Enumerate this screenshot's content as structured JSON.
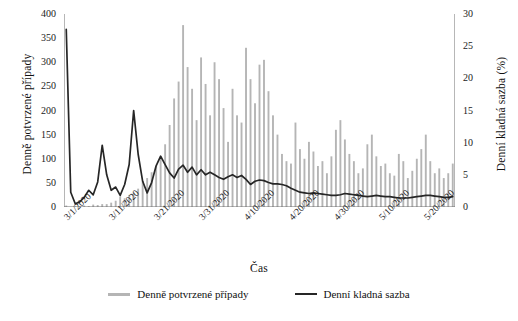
{
  "chart_data": {
    "type": "bar",
    "title": "",
    "xlabel": "Čas",
    "ylabel": "Denně potvrzené případy",
    "y2label": "Denní kladná sazba (%)",
    "ylim": [
      0,
      400
    ],
    "y2lim": [
      0,
      30
    ],
    "grid": false,
    "legend_position": "bottom",
    "y_ticks": [
      "0",
      "50",
      "100",
      "150",
      "200",
      "250",
      "300",
      "350",
      "400"
    ],
    "y2_ticks": [
      "0",
      "5",
      "10",
      "15",
      "20",
      "25",
      "30"
    ],
    "x_tick_labels": [
      "3/1/2020",
      "3/11/2020",
      "3/21/2020",
      "3/31/2020",
      "4/10/2020",
      "4/20/2020",
      "4/30/2020",
      "5/10/2020",
      "5/20/2020"
    ],
    "x_tick_indices": [
      0,
      10,
      20,
      30,
      40,
      50,
      60,
      70,
      80
    ],
    "x": [
      "3/1/2020",
      "3/2/2020",
      "3/3/2020",
      "3/4/2020",
      "3/5/2020",
      "3/6/2020",
      "3/7/2020",
      "3/8/2020",
      "3/9/2020",
      "3/10/2020",
      "3/11/2020",
      "3/12/2020",
      "3/13/2020",
      "3/14/2020",
      "3/15/2020",
      "3/16/2020",
      "3/17/2020",
      "3/18/2020",
      "3/19/2020",
      "3/20/2020",
      "3/21/2020",
      "3/22/2020",
      "3/23/2020",
      "3/24/2020",
      "3/25/2020",
      "3/26/2020",
      "3/27/2020",
      "3/28/2020",
      "3/29/2020",
      "3/30/2020",
      "3/31/2020",
      "4/1/2020",
      "4/2/2020",
      "4/3/2020",
      "4/4/2020",
      "4/5/2020",
      "4/6/2020",
      "4/7/2020",
      "4/8/2020",
      "4/9/2020",
      "4/10/2020",
      "4/11/2020",
      "4/12/2020",
      "4/13/2020",
      "4/14/2020",
      "4/15/2020",
      "4/16/2020",
      "4/17/2020",
      "4/18/2020",
      "4/19/2020",
      "4/20/2020",
      "4/21/2020",
      "4/22/2020",
      "4/23/2020",
      "4/24/2020",
      "4/25/2020",
      "4/26/2020",
      "4/27/2020",
      "4/28/2020",
      "4/29/2020",
      "4/30/2020",
      "5/1/2020",
      "5/2/2020",
      "5/3/2020",
      "5/4/2020",
      "5/5/2020",
      "5/6/2020",
      "5/7/2020",
      "5/8/2020",
      "5/9/2020",
      "5/10/2020",
      "5/11/2020",
      "5/12/2020",
      "5/13/2020",
      "5/14/2020",
      "5/15/2020",
      "5/16/2020",
      "5/17/2020",
      "5/18/2020",
      "5/19/2020",
      "5/20/2020",
      "5/21/2020",
      "5/22/2020",
      "5/23/2020",
      "5/24/2020",
      "5/25/2020",
      "5/26/2020"
    ],
    "series": [
      {
        "name": "Denně potvrzené případy",
        "type": "bar",
        "axis": "left",
        "color": "#b5b5b5",
        "values": [
          3,
          0,
          1,
          2,
          3,
          2,
          5,
          4,
          6,
          6,
          9,
          13,
          22,
          18,
          25,
          30,
          38,
          53,
          60,
          72,
          85,
          100,
          130,
          170,
          225,
          260,
          377,
          290,
          245,
          180,
          310,
          255,
          190,
          300,
          265,
          205,
          135,
          245,
          190,
          175,
          330,
          265,
          215,
          295,
          305,
          240,
          190,
          150,
          110,
          95,
          90,
          175,
          120,
          100,
          135,
          115,
          85,
          95,
          70,
          105,
          160,
          180,
          140,
          110,
          95,
          70,
          80,
          130,
          150,
          105,
          85,
          90,
          70,
          65,
          110,
          95,
          60,
          75,
          100,
          120,
          150,
          95,
          70,
          80,
          60,
          70,
          90
        ]
      },
      {
        "name": "Denní kladná sazba",
        "type": "line",
        "axis": "right",
        "color": "#262626",
        "values": [
          27.6,
          2.3,
          0.5,
          0.8,
          1.5,
          2.6,
          1.9,
          3.9,
          9.6,
          5.0,
          2.6,
          3.1,
          1.8,
          3.5,
          6.6,
          15.0,
          8.2,
          4.0,
          2.2,
          3.8,
          6.4,
          7.9,
          6.6,
          5.3,
          4.5,
          5.9,
          6.5,
          5.4,
          6.2,
          5.0,
          5.8,
          5.0,
          5.4,
          5.0,
          4.6,
          4.3,
          4.7,
          5.0,
          4.6,
          4.9,
          4.3,
          3.5,
          4.0,
          4.2,
          4.1,
          3.8,
          3.6,
          3.6,
          3.5,
          3.3,
          2.9,
          2.6,
          2.3,
          2.2,
          2.1,
          2.2,
          2.1,
          2.0,
          1.9,
          1.8,
          1.8,
          1.9,
          2.1,
          2.0,
          1.9,
          1.8,
          1.7,
          1.6,
          1.7,
          1.8,
          1.7,
          1.6,
          1.6,
          1.5,
          1.4,
          1.4,
          1.4,
          1.5,
          1.6,
          1.7,
          1.8,
          1.8,
          1.7,
          1.6,
          1.5,
          1.5,
          1.6
        ]
      }
    ]
  },
  "legend": {
    "items": [
      {
        "label": "Denně potvrzené případy",
        "color": "#b5b5b5"
      },
      {
        "label": "Denní kladná sazba",
        "color": "#262626"
      }
    ]
  },
  "colors": {
    "bars": "#b5b5b5",
    "line": "#262626",
    "axis": "#6f6f6f",
    "text": "#1a1a1a"
  }
}
